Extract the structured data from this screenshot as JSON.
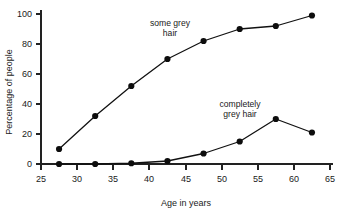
{
  "chart_data": {
    "type": "line",
    "title": "",
    "xlabel": "Age in years",
    "ylabel": "Percentage of people",
    "xlim": [
      25,
      65
    ],
    "ylim": [
      0,
      100
    ],
    "xticks": [
      25,
      30,
      35,
      40,
      45,
      50,
      55,
      60,
      65
    ],
    "yticks": [
      0,
      20,
      40,
      60,
      80,
      100
    ],
    "grid": false,
    "legend_position": "inline-annotation",
    "x": [
      27.5,
      32.5,
      37.5,
      42.5,
      47.5,
      52.5,
      57.5,
      62.5
    ],
    "series": [
      {
        "name": "some grey hair",
        "label_line1": "some grey",
        "label_line2": "hair",
        "values": [
          10,
          32,
          52,
          70,
          82,
          90,
          92,
          99
        ],
        "marker": "filled-circle",
        "color": "#0d0d0d"
      },
      {
        "name": "completely grey hair",
        "label_line1": "completely",
        "label_line2": "grey hair",
        "values": [
          0,
          0,
          0.5,
          2,
          7,
          15,
          30,
          21
        ],
        "marker": "filled-circle",
        "color": "#0d0d0d"
      }
    ],
    "annotations": [
      {
        "text_line1": "some grey",
        "text_line2": "hair",
        "x_px": 170,
        "y_px": 26
      },
      {
        "text_line1": "completely",
        "text_line2": "grey hair",
        "x_px": 240,
        "y_px": 107
      }
    ],
    "colors": {
      "axis": "#222222",
      "line": "#111111",
      "marker": "#0d0d0d",
      "background": "#ffffff",
      "text": "#1a1a1a"
    }
  },
  "geometry": {
    "plot_left_px": 41,
    "plot_right_px": 330,
    "plot_top_px": 14,
    "plot_bottom_px": 164
  }
}
